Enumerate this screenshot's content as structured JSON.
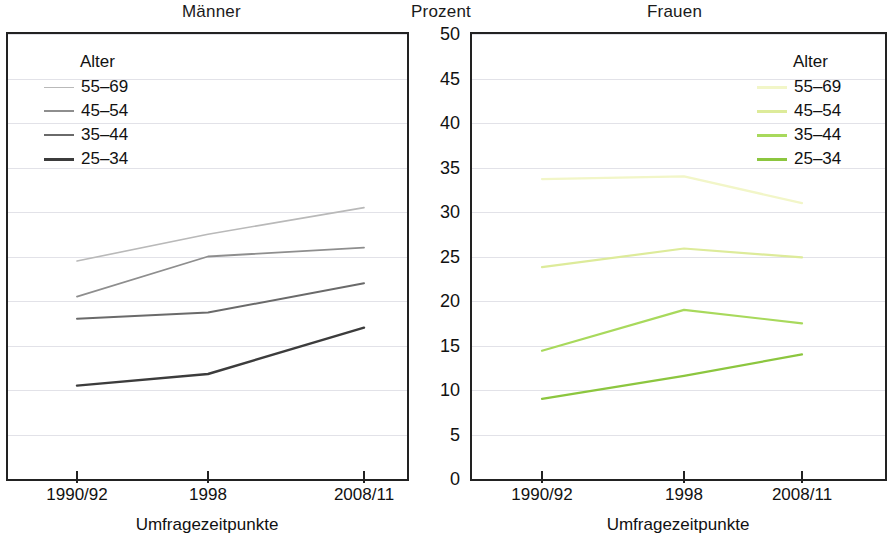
{
  "titles": {
    "left_panel": "Männer",
    "axis_center": "Prozent",
    "right_panel": "Frauen"
  },
  "axes": {
    "y_label": "Prozent",
    "y_ticks": [
      "0",
      "5",
      "10",
      "15",
      "20",
      "25",
      "30",
      "35",
      "40",
      "45",
      "50"
    ],
    "x_ticks": [
      "1990/92",
      "1998",
      "2008/11"
    ],
    "x_title": "Umfragezeitpunkte"
  },
  "legend_left": {
    "title": "Alter",
    "items": [
      {
        "label": "55–69",
        "color": "#b9b9b9"
      },
      {
        "label": "45–54",
        "color": "#8e8e8e"
      },
      {
        "label": "35–44",
        "color": "#6a6a6a"
      },
      {
        "label": "25–34",
        "color": "#3c3c3c"
      }
    ]
  },
  "legend_right": {
    "title": "Alter",
    "items": [
      {
        "label": "55–69",
        "color": "#f2f6c8"
      },
      {
        "label": "45–54",
        "color": "#ddeb9a"
      },
      {
        "label": "35–44",
        "color": "#a8d95c"
      },
      {
        "label": "25–34",
        "color": "#8cc63f"
      }
    ]
  },
  "chart_data": [
    {
      "type": "line",
      "title": "Männer",
      "xlabel": "Umfragezeitpunkte",
      "ylabel": "Prozent",
      "categories": [
        "1990/92",
        "1998",
        "2008/11"
      ],
      "ylim": [
        0,
        50
      ],
      "ytick_step": 5,
      "grid": true,
      "legend_title": "Alter",
      "legend_position": "top-left inside",
      "series": [
        {
          "name": "55–69",
          "values": [
            24.5,
            27.5,
            30.5
          ],
          "color": "#b9b9b9"
        },
        {
          "name": "45–54",
          "values": [
            20.5,
            25.0,
            26.0
          ],
          "color": "#8e8e8e"
        },
        {
          "name": "35–44",
          "values": [
            18.0,
            18.7,
            22.0
          ],
          "color": "#6a6a6a"
        },
        {
          "name": "25–34",
          "values": [
            10.5,
            11.8,
            17.0
          ],
          "color": "#3c3c3c"
        }
      ]
    },
    {
      "type": "line",
      "title": "Frauen",
      "xlabel": "Umfragezeitpunkte",
      "ylabel": "Prozent",
      "categories": [
        "1990/92",
        "1998",
        "2008/11"
      ],
      "ylim": [
        0,
        50
      ],
      "ytick_step": 5,
      "grid": true,
      "legend_title": "Alter",
      "legend_position": "top-right inside",
      "series": [
        {
          "name": "55–69",
          "values": [
            33.7,
            34.0,
            31.0
          ],
          "color": "#f2f6c8"
        },
        {
          "name": "45–54",
          "values": [
            23.8,
            25.9,
            24.9
          ],
          "color": "#ddeb9a"
        },
        {
          "name": "35–44",
          "values": [
            14.4,
            19.0,
            17.5
          ],
          "color": "#a8d95c"
        },
        {
          "name": "25–34",
          "values": [
            9.0,
            11.6,
            14.0
          ],
          "color": "#8cc63f"
        }
      ]
    }
  ]
}
